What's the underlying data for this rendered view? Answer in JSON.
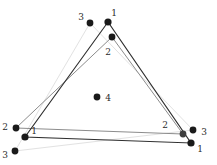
{
  "figure": {
    "type": "point-cluster-triangle-diagram",
    "background_color": "#ffffff",
    "canvas": {
      "width": 217,
      "height": 165
    },
    "point_color_dark": "#1a1a1a",
    "point_color_mid": "#3d3d3d",
    "label_color": "#2b2b2b",
    "point_radius": 3.4,
    "triangles": [
      {
        "id": 1,
        "name": "triangle-1",
        "stroke": "#2e2e2e",
        "stroke_width": 1.1,
        "vertices": [
          {
            "label": "1",
            "x": 108,
            "y": 22
          },
          {
            "label": "1",
            "x": 25,
            "y": 137
          },
          {
            "label": "1",
            "x": 191,
            "y": 143
          }
        ]
      },
      {
        "id": 2,
        "name": "triangle-2",
        "stroke": "#8c8c8c",
        "stroke_width": 1.0,
        "vertices": [
          {
            "label": "2",
            "x": 112,
            "y": 37
          },
          {
            "label": "2",
            "x": 16,
            "y": 128
          },
          {
            "label": "2",
            "x": 183,
            "y": 134
          }
        ]
      },
      {
        "id": 3,
        "name": "triangle-3",
        "stroke": "#e2e2e2",
        "stroke_width": 1.0,
        "vertices": [
          {
            "label": "3",
            "x": 90,
            "y": 23
          },
          {
            "label": "3",
            "x": 15,
            "y": 151
          },
          {
            "label": "3",
            "x": 193,
            "y": 130
          }
        ]
      }
    ],
    "points": [
      {
        "name": "point-t1-apex",
        "label": "1",
        "x": 108,
        "y": 22,
        "color": "#1a1a1a",
        "r": 3.6,
        "label_dx": 6,
        "label_dy": -9
      },
      {
        "name": "point-t3-apex",
        "label": "3",
        "x": 90,
        "y": 23,
        "color": "#1a1a1a",
        "r": 3.4,
        "label_dx": -9,
        "label_dy": -6
      },
      {
        "name": "point-t2-apex",
        "label": "2",
        "x": 112,
        "y": 37,
        "color": "#1a1a1a",
        "r": 3.4,
        "label_dx": -4,
        "label_dy": 15
      },
      {
        "name": "point-center-4",
        "label": "4",
        "x": 97,
        "y": 97,
        "color": "#1a1a1a",
        "r": 3.4,
        "label_dx": 11,
        "label_dy": 1
      },
      {
        "name": "point-t2-left",
        "label": "2",
        "x": 16,
        "y": 128,
        "color": "#1a1a1a",
        "r": 3.4,
        "label_dx": -11,
        "label_dy": -1
      },
      {
        "name": "point-t1-left",
        "label": "1",
        "x": 25,
        "y": 137,
        "color": "#1a1a1a",
        "r": 3.6,
        "label_dx": 9,
        "label_dy": -6
      },
      {
        "name": "point-t3-left",
        "label": "3",
        "x": 15,
        "y": 151,
        "color": "#1a1a1a",
        "r": 3.4,
        "label_dx": -10,
        "label_dy": 4
      },
      {
        "name": "point-t2-right",
        "label": "2",
        "x": 183,
        "y": 134,
        "color": "#3d3d3d",
        "r": 3.4,
        "label_dx": -18,
        "label_dy": -9
      },
      {
        "name": "point-t3-right",
        "label": "3",
        "x": 193,
        "y": 130,
        "color": "#1a1a1a",
        "r": 3.4,
        "label_dx": 11,
        "label_dy": 2
      },
      {
        "name": "point-t1-right",
        "label": "1",
        "x": 191,
        "y": 143,
        "color": "#1a1a1a",
        "r": 3.6,
        "label_dx": 9,
        "label_dy": 6
      }
    ]
  }
}
